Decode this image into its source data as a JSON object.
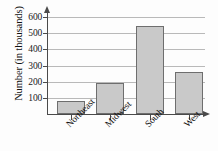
{
  "chart_data": {
    "type": "bar",
    "title": "",
    "xlabel": "",
    "ylabel": "Number (in thousands)",
    "categories": [
      "Northeast",
      "Midwest",
      "South",
      "West"
    ],
    "values": [
      80,
      190,
      545,
      260
    ],
    "ylim": [
      0,
      620
    ],
    "yticks": [
      100,
      200,
      300,
      400,
      500,
      600
    ],
    "ytick_labels": [
      "100",
      "200",
      "300",
      "400",
      "500",
      "600"
    ],
    "grid": true,
    "legend": null,
    "bar_color": "#c9c9c9",
    "bar_border_color": "#6e6e6e",
    "axis_color": "#4a4a4a",
    "gridline_color": "#b9b9b9",
    "background_color": "#fdfdfd",
    "x_tick_label_rotation": -45
  }
}
